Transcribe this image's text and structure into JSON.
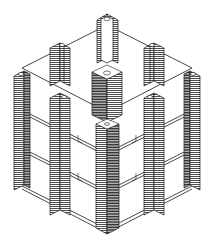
{
  "diagram": {
    "type": "isometric architectural drawing",
    "colors": {
      "background": "#ffffff",
      "line": "#1a1a1a",
      "hatch": "#3a3a3a"
    },
    "floors": 3,
    "pillars": [
      {
        "id": "back-top-fin",
        "position": "rear corner"
      },
      {
        "id": "back-left-fin",
        "position": "rear left edge"
      },
      {
        "id": "back-right-fin",
        "position": "rear right edge"
      },
      {
        "id": "center-cross",
        "position": "center"
      },
      {
        "id": "left-corner",
        "position": "left corner"
      },
      {
        "id": "right-corner",
        "position": "right corner"
      },
      {
        "id": "front-left-mid",
        "position": "front left edge"
      },
      {
        "id": "front-right-mid",
        "position": "front right edge"
      },
      {
        "id": "front-corner",
        "position": "front corner"
      }
    ]
  }
}
